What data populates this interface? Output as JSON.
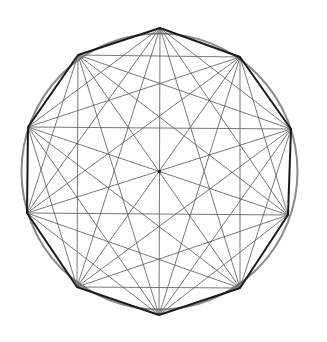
{
  "diagram": {
    "type": "complete-graph-decagon",
    "title": "",
    "background": "#ffffff",
    "circle": {
      "cx": 159.5,
      "cy": 171.5,
      "r": 138,
      "stroke": "#8a8a8a",
      "stroke_width": 2
    },
    "polygon": {
      "sides": 10,
      "stroke": "#1a1a1a",
      "stroke_width": 2
    },
    "diagonals": {
      "stroke": "#555555",
      "stroke_width": 0.8
    },
    "center_dot": {
      "r": 1.5,
      "fill": "#111111"
    },
    "vertices": [
      [
        160,
        28
      ],
      [
        240,
        57
      ],
      [
        291,
        129
      ],
      [
        288,
        215
      ],
      [
        240,
        288
      ],
      [
        159,
        315
      ],
      [
        77,
        287
      ],
      [
        27,
        213
      ],
      [
        28,
        127
      ],
      [
        78,
        55
      ]
    ]
  }
}
